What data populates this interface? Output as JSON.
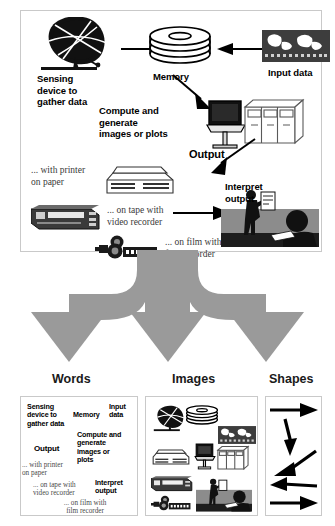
{
  "figure": {
    "colors": {
      "funnel_gray": "#9a9a9a",
      "panel_border": "#c9c9c9",
      "ink": "#000000",
      "serif_ink": "#3a3a3a",
      "scene_gray": "#8c8c8c"
    }
  },
  "top_panel": {
    "labels": {
      "sensing_device": "Sensing\ndevice to\ngather data",
      "sensing_device_lines": [
        "Sensing",
        "device to",
        "gather data"
      ],
      "memory": "Memory",
      "input_data": "Input data",
      "compute": "Compute and\ngenerate\nimages or plots",
      "compute_lines": [
        "Compute and",
        "generate",
        "images or plots"
      ],
      "output": "Output",
      "with_printer": "... with printer\non paper",
      "with_printer_lines": [
        "... with printer",
        "on paper"
      ],
      "on_tape": "... on tape with\nvideo recorder",
      "on_tape_lines": [
        "... on tape with",
        "video recorder"
      ],
      "on_film": "... on film with\nfilm recorder",
      "on_film_lines": [
        "... on film with",
        "film recorder"
      ],
      "interpret": "Interpret\noutput",
      "interpret_lines": [
        "Interpret",
        "output"
      ]
    },
    "icons": [
      {
        "name": "satellite-dish-icon",
        "label": "Sensing device to gather data"
      },
      {
        "name": "disk-stack-icon",
        "label": "Memory"
      },
      {
        "name": "film-strip-icon",
        "label": "Input data"
      },
      {
        "name": "computer-workstation-icon",
        "label": "Compute and generate images or plots"
      },
      {
        "name": "mainframe-cabinets-icon",
        "label": "Compute and generate images or plots"
      },
      {
        "name": "printer-icon",
        "label": "... with printer on paper"
      },
      {
        "name": "video-recorder-icon",
        "label": "... on tape with video recorder"
      },
      {
        "name": "film-recorder-icon",
        "label": "... on film with film recorder"
      },
      {
        "name": "presentation-scene-icon",
        "label": "Interpret output"
      }
    ],
    "arrows": [
      {
        "name": "arrow-dish-to-memory",
        "from": "satellite dish",
        "to": "memory",
        "direction": "right"
      },
      {
        "name": "arrow-input-to-memory",
        "from": "input data",
        "to": "memory",
        "direction": "left"
      },
      {
        "name": "arrow-memory-to-compute",
        "from": "memory",
        "to": "compute",
        "direction": "down-right"
      },
      {
        "name": "arrow-compute-to-printer",
        "from": "compute output",
        "to": "printer",
        "direction": "down-left"
      },
      {
        "name": "arrow-tape-to-interpret",
        "from": "video recorder",
        "to": "interpret output",
        "direction": "right"
      }
    ]
  },
  "funnel": {
    "name": "three-way-split-arrow",
    "branches": 3,
    "color": "#9a9a9a"
  },
  "columns": [
    {
      "key": "words",
      "heading": "Words",
      "items_bold": [
        "Sensing\ndevice to\ngather data",
        "Memory",
        "Input\ndata",
        "Compute and\ngenerate\nimages or\nplots",
        "Output",
        "Interpret\noutput"
      ],
      "items_serif": [
        "... with printer\non paper",
        "... on tape with\nvideo recorder",
        "... on film with\nfilm recorder"
      ],
      "words": {
        "sensing_lines": [
          "Sensing",
          "device to",
          "gather data"
        ],
        "memory": "Memory",
        "input_lines": [
          "Input",
          "data"
        ],
        "compute_lines": [
          "Compute and",
          "generate",
          "images or",
          "plots"
        ],
        "output": "Output",
        "interpret_lines": [
          "Interpret",
          "output"
        ],
        "printer_lines": [
          "... with printer",
          "on paper"
        ],
        "tape_lines": [
          "... on tape with",
          "video recorder"
        ],
        "film_lines": [
          "... on film with",
          "film recorder"
        ]
      }
    },
    {
      "key": "images",
      "heading": "Images",
      "icons": [
        "satellite-dish-icon",
        "disk-stack-icon",
        "film-strip-icon",
        "printer-icon",
        "computer-workstation-icon",
        "mainframe-cabinets-icon",
        "video-recorder-icon",
        "film-recorder-icon",
        "presentation-scene-icon"
      ]
    },
    {
      "key": "shapes",
      "heading": "Shapes",
      "arrows": [
        {
          "name": "arrow-right-1",
          "direction": "right"
        },
        {
          "name": "arrow-down-2",
          "direction": "down"
        },
        {
          "name": "arrow-down-left-3",
          "direction": "down-left"
        },
        {
          "name": "arrow-left-4",
          "direction": "left"
        },
        {
          "name": "arrow-right-5",
          "direction": "right"
        }
      ]
    }
  ]
}
